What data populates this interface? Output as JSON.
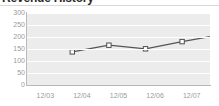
{
  "widget": {
    "title": "Revenue History",
    "title_clipped": true
  },
  "chart_data": {
    "type": "line",
    "title": "Revenue History",
    "xlabel": "",
    "ylabel": "",
    "categories": [
      "12/03",
      "12/04",
      "12/05",
      "12/06",
      "12/07"
    ],
    "values": [
      192,
      220,
      205,
      235,
      262
    ],
    "series": [
      {
        "name": "Revenue",
        "values": [
          192,
          220,
          205,
          235,
          262
        ]
      }
    ],
    "ylim": [
      0,
      300
    ],
    "ytick_labels": [
      "300",
      "250",
      "200",
      "150",
      "100",
      "50",
      "0"
    ],
    "ytick_values": [
      300,
      250,
      200,
      150,
      100,
      50,
      0
    ],
    "grid": true,
    "grid_orientation": "horizontal",
    "legend": false,
    "marker": "square-open",
    "colors": {
      "line": "#555555",
      "marker_fill": "#ffffff",
      "marker_stroke": "#4d4d4d",
      "plot_background": "#ececec",
      "gridline": "#ffffff",
      "axis": "#b9b9b9",
      "tick_label": "#9a9a9a",
      "title": "#2b2b2b"
    }
  }
}
